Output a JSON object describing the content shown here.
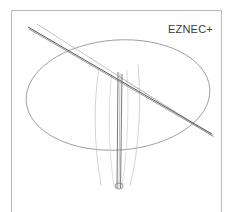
{
  "app": {
    "name_label": "EZNEC+",
    "label_position": {
      "x": 168,
      "y": 23
    },
    "label_font_size": 11,
    "label_color": "#3a3a3a"
  },
  "view": {
    "name": "antenna-wire-view",
    "frame": {
      "x": 11,
      "y": 10,
      "width": 211,
      "height": 202
    },
    "frame_border_color": "#b9b9b9",
    "background_color": "#ffffff",
    "canvas_width": 233,
    "canvas_height": 212
  },
  "colors": {
    "wire_dark": "#5a5a5a",
    "wire_mid": "#8e8e8e",
    "wire_light": "#b0b0b0",
    "wire_faint": "#c6c6c6",
    "ground_ellipse": "#8a8a8a",
    "source_marker": "#8a8a8a",
    "frame": "#b9b9b9"
  },
  "geometry": {
    "ground_plane": {
      "name": "ground-plane-ellipse",
      "shape": "ellipse",
      "cx": 118,
      "cy": 95,
      "rx": 92,
      "ry": 55,
      "rotation_deg": -4,
      "stroke": "#8a8a8a",
      "stroke_width": 0.8
    },
    "mast": {
      "name": "vertical-mast",
      "lines": [
        {
          "id": "mast-left-edge",
          "x1": 118,
          "y1": 72,
          "x2": 117,
          "y2": 188,
          "stroke": "#6a6a6a",
          "width": 0.9
        },
        {
          "id": "mast-right-edge",
          "x1": 122,
          "y1": 74,
          "x2": 120.5,
          "y2": 188,
          "stroke": "#6a6a6a",
          "width": 0.9
        },
        {
          "id": "mast-center",
          "x1": 120,
          "y1": 73,
          "x2": 119,
          "y2": 188,
          "stroke": "#9a9a9a",
          "width": 0.6
        }
      ]
    },
    "crossing_elements": [
      {
        "id": "element-primary-dark",
        "name": "dipole-element-upper",
        "x1": 28,
        "y1": 27,
        "x2": 212,
        "y2": 134,
        "stroke": "#5a5a5a",
        "width": 1.0
      },
      {
        "id": "element-primary-dark-2",
        "name": "dipole-element-upper-parallel",
        "x1": 29,
        "y1": 29,
        "x2": 213,
        "y2": 136,
        "stroke": "#6e6e6e",
        "width": 0.7
      },
      {
        "id": "element-secondary-light",
        "name": "dipole-element-lower",
        "x1": 37,
        "y1": 24,
        "x2": 214,
        "y2": 137,
        "stroke": "#aaaaaa",
        "width": 0.7
      },
      {
        "id": "element-short-light",
        "name": "dipole-element-short",
        "x1": 118,
        "y1": 76,
        "x2": 213,
        "y2": 135,
        "stroke": "#b4b4b4",
        "width": 0.6
      }
    ],
    "radial_wires": [
      {
        "id": "radial-left",
        "name": "radial-wire-left",
        "path": "M 99 68 C 94 100, 93 140, 101 185",
        "stroke": "#c0c0c0",
        "width": 0.7
      },
      {
        "id": "radial-left-inner",
        "name": "radial-wire-left-inner",
        "path": "M 112 72 C 108 104, 108 146, 114 186",
        "stroke": "#c9c9c9",
        "width": 0.6
      },
      {
        "id": "radial-right",
        "name": "radial-wire-right",
        "path": "M 138 64 C 141 100, 140 146, 130 186",
        "stroke": "#c0c0c0",
        "width": 0.7
      },
      {
        "id": "radial-right-inner",
        "name": "radial-wire-right-inner",
        "path": "M 127 70 C 129 104, 128 148, 122 186",
        "stroke": "#c9c9c9",
        "width": 0.6
      }
    ],
    "source_marker": {
      "name": "source-feedpoint-marker",
      "cx": 119,
      "cy": 186,
      "rx": 4.0,
      "ry": 3.0,
      "stroke": "#8a8a8a",
      "width": 0.9
    }
  }
}
